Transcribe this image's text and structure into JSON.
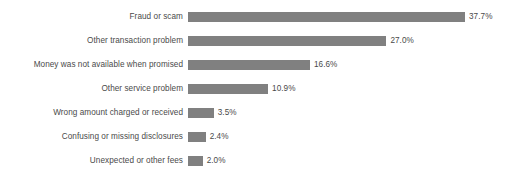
{
  "chart_data": {
    "type": "bar",
    "orientation": "horizontal",
    "title": "",
    "subtitle": "",
    "xlabel": "",
    "ylabel": "",
    "grid": false,
    "legend": null,
    "xlim": [
      0,
      37.7
    ],
    "bar_color": "#808080",
    "text_color": "#4a4a4a",
    "background": "#ffffff",
    "categories": [
      "Fraud or scam",
      "Other transaction problem",
      "Money was not available when promised",
      "Other service problem",
      "Wrong amount charged or received",
      "Confusing or missing disclosures",
      "Unexpected or other fees"
    ],
    "values": [
      37.7,
      27.0,
      16.6,
      10.9,
      3.5,
      2.4,
      2.0
    ],
    "value_labels": [
      "37.7%",
      "27.0%",
      "16.6%",
      "10.9%",
      "3.5%",
      "2.4%",
      "2.0%"
    ]
  }
}
